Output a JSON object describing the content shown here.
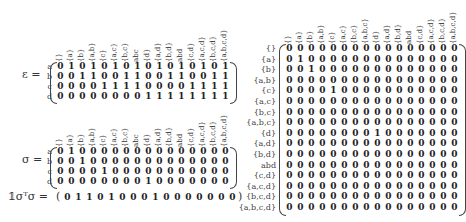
{
  "matrices": {
    "epsilon": {
      "label": "ε =",
      "row_labels": [
        "a",
        "b",
        "c",
        "d"
      ],
      "col_labels": [
        "{}",
        "{a}",
        "{b}",
        "{a,b}",
        "{c}",
        "{a,c}",
        "{b,c}",
        "abc",
        "{d}",
        "{a,d}",
        "{b,d}",
        "abd",
        "{c,d}",
        "{a,c,d}",
        "{b,c,d}",
        "{a,b,c,d}"
      ],
      "rows": [
        [
          0,
          1,
          0,
          1,
          0,
          1,
          0,
          1,
          0,
          1,
          0,
          1,
          0,
          1,
          0,
          1
        ],
        [
          0,
          0,
          1,
          1,
          0,
          0,
          1,
          1,
          0,
          0,
          1,
          1,
          0,
          0,
          1,
          1
        ],
        [
          0,
          0,
          0,
          0,
          1,
          1,
          1,
          1,
          0,
          0,
          0,
          0,
          1,
          1,
          1,
          1
        ],
        [
          0,
          0,
          0,
          0,
          0,
          0,
          0,
          0,
          1,
          1,
          1,
          1,
          1,
          1,
          1,
          1
        ]
      ]
    },
    "sigma": {
      "label": "σ =",
      "row_labels": [
        "a",
        "b",
        "c",
        "d"
      ],
      "col_labels": [
        "{}",
        "{a}",
        "{b}",
        "{a,b}",
        "{c}",
        "{a,c}",
        "{b,c}",
        "abc",
        "{d}",
        "{a,d}",
        "{b,d}",
        "abd",
        "{c,d}",
        "{a,c,d}",
        "{b,c,d}",
        "{a,b,c,d}"
      ],
      "rows": [
        [
          0,
          1,
          0,
          0,
          0,
          0,
          0,
          0,
          0,
          0,
          0,
          0,
          0,
          0,
          0,
          0
        ],
        [
          0,
          0,
          1,
          0,
          0,
          0,
          0,
          0,
          0,
          0,
          0,
          0,
          0,
          0,
          0,
          0
        ],
        [
          0,
          0,
          0,
          0,
          1,
          0,
          0,
          0,
          0,
          0,
          0,
          0,
          0,
          0,
          0,
          0
        ],
        [
          0,
          0,
          0,
          0,
          0,
          0,
          0,
          0,
          1,
          0,
          0,
          0,
          0,
          0,
          0,
          0
        ]
      ]
    },
    "vector": {
      "label": "𝟙σᵀσ =",
      "values": [
        0,
        1,
        1,
        0,
        1,
        0,
        0,
        0,
        1,
        0,
        0,
        0,
        0,
        0,
        0,
        0
      ]
    },
    "product": {
      "row_labels": [
        "{}",
        "{a}",
        "{b}",
        "{a,b}",
        "{c}",
        "{a,c}",
        "{b,c}",
        "{a,b,c}",
        "{d}",
        "{a,d}",
        "{b,d}",
        "abd",
        "{c,d}",
        "{a,c,d}",
        "{b,c,d}",
        "{a,b,c,d}"
      ],
      "col_labels": [
        "{}",
        "{a}",
        "{b}",
        "{a,b}",
        "{c}",
        "{a,c}",
        "{b,c}",
        "{a,b,c}",
        "{d}",
        "{a,d}",
        "{b,d}",
        "abd",
        "{c,d}",
        "{a,c,d}",
        "{b,c,d}",
        "{a,b,c,d}"
      ],
      "ones": [
        [
          1,
          1
        ],
        [
          2,
          2
        ],
        [
          4,
          4
        ],
        [
          8,
          8
        ]
      ]
    }
  }
}
